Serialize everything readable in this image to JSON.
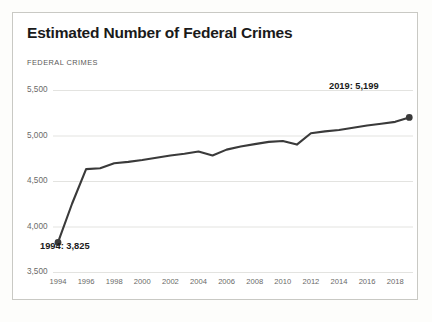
{
  "card": {
    "title": "Estimated Number of Federal Crimes",
    "axis_caption": "FEDERAL CRIMES"
  },
  "annotations": {
    "start": "1994: 3,825",
    "end": "2019: 5,199"
  },
  "colors": {
    "line": "#3a3a3a",
    "grid": "#e3e3e0",
    "text": "#1a1a1a",
    "muted": "#6a6a68",
    "card_border": "#c9c9c4",
    "background": "#ffffff"
  },
  "chart_data": {
    "type": "line",
    "title": "Estimated Number of Federal Crimes",
    "xlabel": "",
    "ylabel": "FEDERAL CRIMES",
    "ylim": [
      3500,
      5500
    ],
    "xlim": [
      1994,
      2019
    ],
    "yticks": [
      "3,500",
      "4,000",
      "4,500",
      "5,000",
      "5,500"
    ],
    "ytick_values": [
      3500,
      4000,
      4500,
      5000,
      5500
    ],
    "xticks": [
      "1994",
      "1996",
      "1998",
      "2000",
      "2002",
      "2004",
      "2006",
      "2008",
      "2010",
      "2012",
      "2014",
      "2016",
      "2018"
    ],
    "xtick_values": [
      1994,
      1996,
      1998,
      2000,
      2002,
      2004,
      2006,
      2008,
      2010,
      2012,
      2014,
      2016,
      2018
    ],
    "grid": true,
    "grid_axis": "y",
    "legend": false,
    "markers": [
      {
        "x": 1994,
        "y": 3825,
        "label": "1994: 3,825"
      },
      {
        "x": 2019,
        "y": 5199,
        "label": "2019: 5,199"
      }
    ],
    "series": [
      {
        "name": "Federal Crimes",
        "color": "#3a3a3a",
        "x": [
          1994,
          1995,
          1996,
          1997,
          1998,
          1999,
          2000,
          2001,
          2002,
          2003,
          2004,
          2005,
          2006,
          2007,
          2008,
          2009,
          2010,
          2011,
          2012,
          2013,
          2014,
          2015,
          2016,
          2017,
          2018,
          2019
        ],
        "values": [
          3825,
          4250,
          4630,
          4640,
          4695,
          4710,
          4730,
          4755,
          4780,
          4800,
          4825,
          4780,
          4845,
          4880,
          4905,
          4930,
          4940,
          4900,
          5025,
          5045,
          5060,
          5085,
          5110,
          5130,
          5150,
          5199
        ]
      }
    ]
  }
}
